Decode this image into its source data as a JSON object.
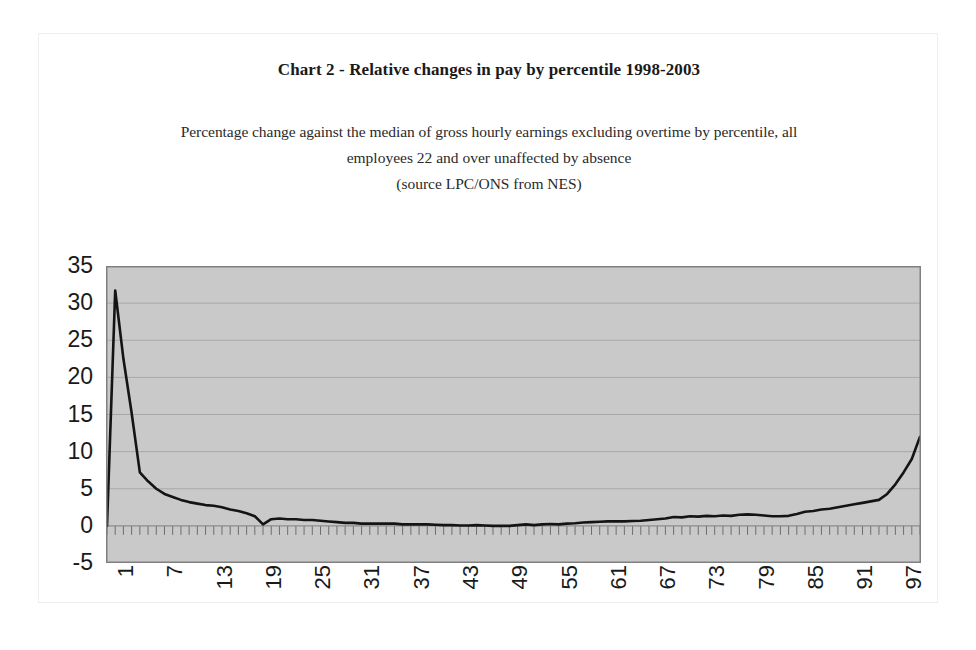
{
  "chart": {
    "title": "Chart 2 - Relative changes in pay by percentile 1998-2003",
    "subtitle_line1": "Percentage change against the median of gross hourly earnings excluding overtime by percentile, all",
    "subtitle_line2": "employees 22 and over unaffected by absence",
    "subtitle_line3": "(source LPC/ONS from NES)",
    "plot_background": "#c9c9c9",
    "gridline_color": "#a8a8a8",
    "series_color": "#141414",
    "border_color": "#808080"
  },
  "chart_data": {
    "type": "line",
    "title": "Chart 2 - Relative changes in pay by percentile 1998-2003",
    "subtitle": "Percentage change against the median of gross hourly earnings excluding overtime by percentile, all employees 22 and over unaffected by absence (source LPC/ONS from NES)",
    "source": "LPC/ONS from NES",
    "xlabel": "",
    "ylabel": "",
    "grid": true,
    "legend": "none",
    "xlim": [
      1,
      100
    ],
    "ylim": [
      -5,
      35
    ],
    "ytick_labels": [
      "35",
      "30",
      "25",
      "20",
      "15",
      "10",
      "5",
      "0",
      "-5"
    ],
    "yticks": [
      35,
      30,
      25,
      20,
      15,
      10,
      5,
      0,
      -5
    ],
    "xtick_labels": [
      "1",
      "7",
      "13",
      "19",
      "25",
      "31",
      "37",
      "43",
      "49",
      "55",
      "61",
      "67",
      "73",
      "79",
      "85",
      "91",
      "97"
    ],
    "xticks": [
      1,
      7,
      13,
      19,
      25,
      31,
      37,
      43,
      49,
      55,
      61,
      67,
      73,
      79,
      85,
      91,
      97
    ],
    "x": [
      1,
      2,
      3,
      4,
      5,
      6,
      7,
      8,
      9,
      10,
      11,
      12,
      13,
      14,
      15,
      16,
      17,
      18,
      19,
      20,
      21,
      22,
      23,
      24,
      25,
      26,
      27,
      28,
      29,
      30,
      31,
      32,
      33,
      34,
      35,
      36,
      37,
      38,
      39,
      40,
      41,
      42,
      43,
      44,
      45,
      46,
      47,
      48,
      49,
      50,
      51,
      52,
      53,
      54,
      55,
      56,
      57,
      58,
      59,
      60,
      61,
      62,
      63,
      64,
      65,
      66,
      67,
      68,
      69,
      70,
      71,
      72,
      73,
      74,
      75,
      76,
      77,
      78,
      79,
      80,
      81,
      82,
      83,
      84,
      85,
      86,
      87,
      88,
      89,
      90,
      91,
      92,
      93,
      94,
      95,
      96,
      97,
      98,
      99,
      100
    ],
    "series": [
      {
        "name": "Percentage change against the median",
        "values": [
          0.0,
          31.7,
          22.5,
          15.2,
          7.2,
          6.0,
          5.0,
          4.3,
          3.9,
          3.5,
          3.2,
          3.0,
          2.8,
          2.7,
          2.5,
          2.2,
          2.0,
          1.7,
          1.3,
          0.2,
          0.9,
          1.0,
          0.9,
          0.9,
          0.8,
          0.8,
          0.7,
          0.6,
          0.5,
          0.4,
          0.4,
          0.3,
          0.3,
          0.3,
          0.3,
          0.3,
          0.2,
          0.2,
          0.2,
          0.2,
          0.15,
          0.1,
          0.1,
          0.05,
          0.05,
          0.1,
          0.05,
          0.0,
          0.0,
          0.0,
          0.1,
          0.2,
          0.1,
          0.2,
          0.25,
          0.2,
          0.3,
          0.35,
          0.45,
          0.5,
          0.55,
          0.6,
          0.6,
          0.6,
          0.65,
          0.7,
          0.8,
          0.9,
          1.0,
          1.2,
          1.15,
          1.3,
          1.25,
          1.35,
          1.3,
          1.4,
          1.35,
          1.5,
          1.55,
          1.5,
          1.4,
          1.3,
          1.3,
          1.35,
          1.6,
          1.9,
          2.0,
          2.2,
          2.3,
          2.5,
          2.7,
          2.9,
          3.1,
          3.3,
          3.5,
          4.3,
          5.6,
          7.2,
          9.0,
          12.0
        ]
      }
    ]
  },
  "y_axis": {
    "labels": [
      "35",
      "30",
      "25",
      "20",
      "15",
      "10",
      "5",
      "0",
      "-5"
    ]
  },
  "x_axis": {
    "labels": [
      "1",
      "7",
      "13",
      "19",
      "25",
      "31",
      "37",
      "43",
      "49",
      "55",
      "61",
      "67",
      "73",
      "79",
      "85",
      "91",
      "97"
    ]
  }
}
